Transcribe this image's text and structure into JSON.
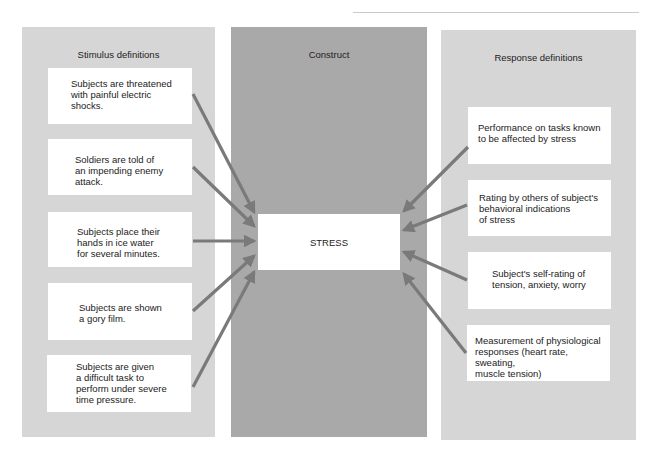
{
  "diagram": {
    "colors": {
      "panel_side": "#d6d6d6",
      "panel_center": "#a9a9a9",
      "arrow": "#7a7a7a",
      "box": "#ffffff"
    },
    "stimulus": {
      "title": "Stimulus definitions",
      "items": [
        {
          "text": "Subjects are threatened\nwith painful electric\nshocks."
        },
        {
          "text": "Soldiers are told of\nan impending enemy\nattack."
        },
        {
          "text": "Subjects place their\nhands in ice water\nfor several minutes."
        },
        {
          "text": "Subjects are shown\na gory film."
        },
        {
          "text": "Subjects are given\na difficult task to\nperform under severe\ntime pressure."
        }
      ]
    },
    "construct": {
      "title": "Construct",
      "label": "STRESS"
    },
    "response": {
      "title": "Response definitions",
      "items": [
        {
          "text": "Performance on tasks known\nto be affected by stress"
        },
        {
          "text": "Rating by others of subject's\nbehavioral indications\nof stress"
        },
        {
          "text": "Subject's self-rating of\ntension, anxiety, worry"
        },
        {
          "text": "Measurement of physiological\nresponses (heart rate, sweating,\nmuscle tension)"
        }
      ]
    }
  }
}
